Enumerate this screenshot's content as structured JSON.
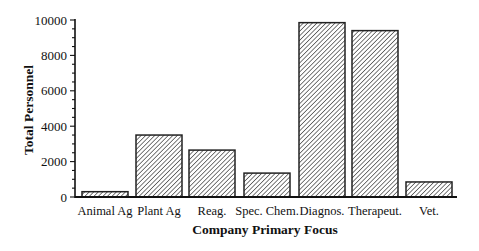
{
  "chart_data": {
    "type": "bar",
    "title": "",
    "xlabel": "Company Primary Focus",
    "ylabel": "Total Personnel",
    "categories": [
      "Animal Ag",
      "Plant Ag",
      "Reag.",
      "Spec. Chem.",
      "Diagnos.",
      "Therapeut.",
      "Vet."
    ],
    "values": [
      300,
      3500,
      2650,
      1350,
      9850,
      9400,
      850
    ],
    "ylim": [
      0,
      10000
    ],
    "yticks": [
      0,
      2000,
      4000,
      6000,
      8000,
      10000
    ],
    "ytick_labels": [
      "0",
      "2000",
      "4000",
      "6000",
      "8000",
      "10000"
    ],
    "grid": false,
    "legend": null,
    "bar_fill": "diagonal-hatch",
    "bar_stroke": "#222222"
  }
}
